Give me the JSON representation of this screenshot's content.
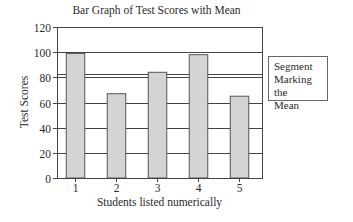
{
  "chart_data": {
    "type": "bar",
    "title": "Bar Graph of Test Scores with Mean",
    "xlabel": "Students listed numerically",
    "ylabel": "Test Scores",
    "categories": [
      "1",
      "2",
      "3",
      "4",
      "5"
    ],
    "values": [
      99,
      67,
      84,
      98,
      65
    ],
    "ylim": [
      0,
      120
    ],
    "yticks": [
      0,
      20,
      40,
      60,
      80,
      100,
      120
    ],
    "grid": true,
    "mean_line": {
      "value": 82.6,
      "label": "Segment Marking the Mean"
    },
    "legend_position": "right",
    "colors": {
      "bar_fill": "#d4d4d4",
      "bar_edge": "#555555",
      "grid": "#444444"
    }
  },
  "legend": {
    "line1": "Segment",
    "line2": "Marking the",
    "line3": "Mean"
  }
}
